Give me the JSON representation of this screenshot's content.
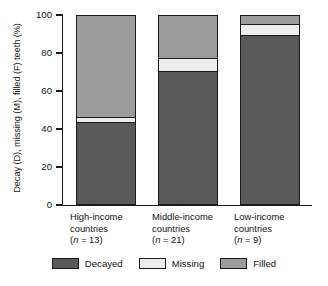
{
  "chart_data": {
    "type": "bar",
    "subtype": "stacked-bar-100-percent",
    "title": "",
    "xlabel": "",
    "ylabel": "Decay (D), missing (M), filled (F) teeth (%)",
    "ylim": [
      0,
      100
    ],
    "yticks": [
      0,
      20,
      40,
      60,
      80,
      100
    ],
    "ytick_labels": [
      "0",
      "20",
      "40",
      "60",
      "80",
      "100"
    ],
    "grid": false,
    "legend_position": "bottom",
    "categories": [
      "High-income countries",
      "Middle-income countries",
      "Low-income countries"
    ],
    "category_lines": [
      {
        "line1": "High-income",
        "line2": "countries",
        "n_prefix": "(",
        "n_italic": "n",
        "n_suffix": " = 13)"
      },
      {
        "line1": "Middle-income",
        "line2": "countries",
        "n_prefix": "(",
        "n_italic": "n",
        "n_suffix": " = 21)"
      },
      {
        "line1": "Low-income",
        "line2": "countries",
        "n_prefix": "(",
        "n_italic": "n",
        "n_suffix": " = 9)"
      }
    ],
    "series": [
      {
        "name": "Decayed",
        "color": "#595959",
        "values": [
          44,
          71,
          90
        ]
      },
      {
        "name": "Missing",
        "color": "#ededed",
        "values": [
          3,
          7,
          6
        ]
      },
      {
        "name": "Filled",
        "color": "#9c9c9c",
        "values": [
          53,
          22,
          4
        ]
      }
    ]
  },
  "legend": {
    "items": [
      {
        "label": "Decayed",
        "color": "#595959"
      },
      {
        "label": "Missing",
        "color": "#ededed"
      },
      {
        "label": "Filled",
        "color": "#9c9c9c"
      }
    ]
  },
  "colors": {
    "decayed": "#595959",
    "missing": "#ededed",
    "filled": "#9c9c9c",
    "axis": "#1a1a1a",
    "background": "#ffffff"
  }
}
